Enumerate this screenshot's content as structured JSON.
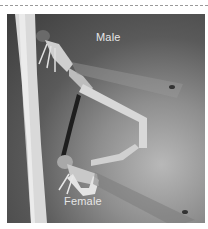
{
  "figure": {
    "labels": {
      "male": "Male",
      "female": "Female"
    },
    "colors": {
      "background": "#ffffff",
      "dash": "#9a9a9a",
      "label_text": "#e6e6e6"
    }
  }
}
